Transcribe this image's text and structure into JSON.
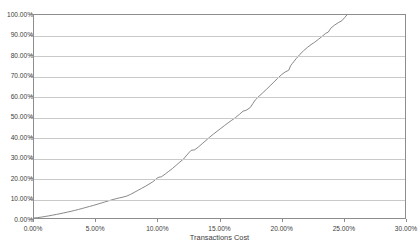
{
  "chart_data": {
    "type": "line",
    "title": "",
    "xlabel": "Transactions Cost",
    "ylabel": "",
    "xlim": [
      0,
      30
    ],
    "ylim": [
      0,
      100
    ],
    "grid": "horizontal",
    "legend": "none",
    "x_tick_labels": [
      "0.00%",
      "5.00%",
      "10.00%",
      "15.00%",
      "20.00%",
      "25.00%",
      "30.00%"
    ],
    "x_tick_values": [
      0,
      5,
      10,
      15,
      20,
      25,
      30
    ],
    "y_tick_labels": [
      "0.00%",
      "10.00%",
      "20.00%",
      "30.00%",
      "40.00%",
      "50.00%",
      "60.00%",
      "70.00%",
      "80.00%",
      "90.00%",
      "100.00%"
    ],
    "y_tick_values": [
      0,
      10,
      20,
      30,
      40,
      50,
      60,
      70,
      80,
      90,
      100
    ],
    "series": [
      {
        "name": "Cumulative share of transactions",
        "color": "#7a7a7a",
        "x": [
          0.0,
          0.3,
          0.6,
          0.9,
          1.2,
          1.5,
          1.8,
          2.1,
          2.4,
          2.7,
          3.0,
          3.3,
          3.6,
          3.9,
          4.2,
          4.5,
          4.8,
          5.1,
          5.4,
          5.7,
          6.0,
          6.3,
          6.6,
          6.9,
          7.2,
          7.5,
          7.8,
          8.1,
          8.4,
          8.7,
          9.0,
          9.3,
          9.6,
          9.8,
          9.95,
          10.1,
          10.3,
          10.6,
          10.9,
          11.2,
          11.5,
          11.8,
          12.1,
          12.3,
          12.5,
          12.7,
          13.0,
          13.3,
          13.6,
          13.9,
          14.2,
          14.5,
          14.8,
          15.1,
          15.4,
          15.7,
          16.0,
          16.3,
          16.6,
          16.9,
          17.2,
          17.5,
          17.7,
          17.9,
          18.2,
          18.5,
          18.8,
          19.1,
          19.4,
          19.7,
          20.0,
          20.3,
          20.6,
          20.75,
          20.9,
          21.2,
          21.5,
          21.8,
          22.1,
          22.4,
          22.7,
          23.0,
          23.3,
          23.6,
          23.8,
          24.0,
          24.3,
          24.6,
          24.9,
          25.1,
          25.3
        ],
        "y": [
          0.0,
          0.2,
          0.45,
          0.75,
          1.05,
          1.4,
          1.75,
          2.1,
          2.5,
          2.9,
          3.3,
          3.75,
          4.2,
          4.7,
          5.2,
          5.7,
          6.2,
          6.75,
          7.3,
          7.85,
          8.4,
          8.95,
          9.45,
          9.9,
          10.3,
          10.8,
          11.6,
          12.6,
          13.6,
          14.6,
          15.6,
          16.7,
          17.8,
          18.8,
          19.6,
          20.1,
          20.3,
          21.6,
          23.0,
          24.4,
          26.0,
          27.6,
          29.1,
          30.6,
          32.0,
          33.3,
          33.6,
          35.0,
          36.6,
          38.2,
          39.8,
          41.3,
          42.7,
          44.1,
          45.5,
          46.9,
          48.2,
          49.5,
          51.0,
          52.6,
          53.2,
          54.5,
          56.4,
          58.2,
          60.0,
          61.7,
          63.4,
          65.2,
          67.0,
          68.8,
          70.5,
          71.9,
          72.8,
          75.0,
          76.2,
          78.5,
          80.6,
          82.4,
          84.0,
          85.4,
          86.6,
          88.0,
          89.5,
          91.0,
          91.6,
          93.5,
          95.0,
          96.2,
          97.2,
          98.6,
          100.0
        ]
      }
    ]
  },
  "axes": {
    "x_title": "Transactions Cost"
  },
  "title_sliver": ""
}
